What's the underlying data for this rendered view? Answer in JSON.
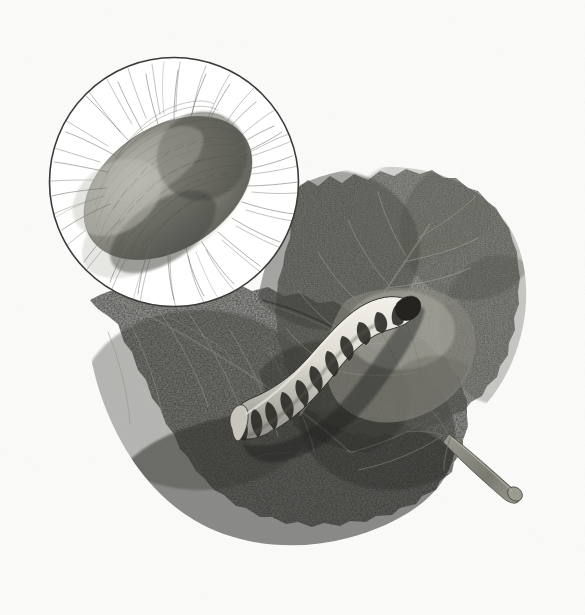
{
  "plate": {
    "title": "Silkworm (Bombyx mori) on mulberry leaves",
    "subject": "silkworm-caterpillar-and-cocoon",
    "medium": "monochrome engraving / stipple lithograph",
    "background_color": "#fbfbfa",
    "width": 585,
    "height": 615
  },
  "palette": {
    "paper": "#fbfbfa",
    "ink_outline": "#2b2b2b",
    "leaf_dark": "#4a4a46",
    "leaf_darkest": "#32322f",
    "leaf_mid": "#6a6a64",
    "leaf_light": "#9a9a92",
    "leaf_vein": "#b9b9b0",
    "cocoon_fiber": "#6e6e68",
    "cocoon_body": "#8c8c84",
    "larva_light": "#e2e0d8",
    "larva_band": "#2e2c28",
    "stem": "#7c7c74"
  },
  "inset": {
    "name": "magnified-cocoon-inset",
    "shape": "circle",
    "center_x": 174,
    "center_y": 182,
    "radius": 125,
    "border_color": "#3a3a38",
    "border_width": 1.6,
    "fill": "#ffffff",
    "content_label": "Cocoon, magnified",
    "cocoon": {
      "name": "silk-cocoon",
      "center_x": 168,
      "center_y": 188,
      "radius_x": 92,
      "radius_y": 62,
      "rotation_deg": -33,
      "fiber_count": 260,
      "description": "ovoid silk cocoon with radiating loose silk fibres"
    }
  },
  "leaves": [
    {
      "name": "leaf-upper-right",
      "label": "Mulberry leaf, upper",
      "tone": "#55554f",
      "serrations": 26
    },
    {
      "name": "leaf-lower-left",
      "label": "Mulberry leaf, lower",
      "tone": "#3d3d39",
      "serrations": 30
    },
    {
      "name": "leaf-pale-patch",
      "label": "Mulberry leaf, pale under-surface",
      "tone": "#8e8e86",
      "serrations": 0
    }
  ],
  "petiole": {
    "name": "leaf-petiole",
    "label": "Leaf stalk (petiole)",
    "color": "#83837a",
    "start_x": 452,
    "start_y": 438,
    "end_x": 522,
    "end_y": 497
  },
  "larva": {
    "name": "silkworm-larva",
    "label": "Silkworm caterpillar",
    "body_color": "#e2e0d8",
    "band_color": "#2e2c28",
    "segment_bands": 12,
    "head_x": 409,
    "head_y": 303,
    "tail_x": 236,
    "tail_y": 431,
    "length_px": 215,
    "max_width_px": 31,
    "description": "pale banded caterpillar curving from lower-left to upper-right across the leaf"
  },
  "annotations": {
    "caption": "",
    "plate_number": "",
    "signature": ""
  }
}
